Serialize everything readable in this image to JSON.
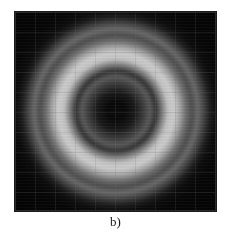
{
  "figure": {
    "caption": "b)",
    "panel_background": "#060606",
    "page_background": "#ffffff",
    "colormap": "grayscale",
    "grid_visible": true,
    "grid_spacing_px": 20,
    "panel": {
      "left_px": 15,
      "top_px": 12,
      "width_px": 201,
      "height_px": 199
    }
  },
  "chart_data": {
    "type": "heatmap",
    "title": "",
    "subtitle": "",
    "xlabel": "",
    "ylabel": "",
    "annotations": [
      "b)"
    ],
    "legend": [],
    "legend_position": "none",
    "grid": true,
    "colormap": "gray",
    "value_range": [
      0,
      255
    ],
    "center": {
      "x_px": 115,
      "y_px": 110
    },
    "xlim": [
      0,
      201
    ],
    "ylim": [
      0,
      199
    ],
    "radial_profile": {
      "radius_px": [
        0,
        9,
        19,
        28,
        34,
        40,
        46,
        52,
        58,
        64,
        70,
        76,
        82,
        88,
        94,
        100
      ],
      "intensity": [
        11,
        9,
        26,
        62,
        90,
        51,
        125,
        194,
        205,
        165,
        108,
        70,
        95,
        58,
        21,
        7
      ]
    },
    "rings": [
      {
        "name": "dark-core",
        "r_inner_px": 0,
        "r_outer_px": 20,
        "mean_intensity": 11,
        "hex": "#0b0b0b"
      },
      {
        "name": "inner-rise",
        "r_inner_px": 20,
        "r_outer_px": 28,
        "mean_intensity": 40,
        "hex": "#282828"
      },
      {
        "name": "first-gray-ring",
        "r_inner_px": 28,
        "r_outer_px": 36,
        "mean_intensity": 100,
        "hex": "#646464"
      },
      {
        "name": "first-dark-gap",
        "r_inner_px": 36,
        "r_outer_px": 44,
        "mean_intensity": 54,
        "hex": "#363636"
      },
      {
        "name": "bright-annulus",
        "r_inner_px": 44,
        "r_outer_px": 70,
        "mean_intensity": 199,
        "hex": "#c7c7c7"
      },
      {
        "name": "second-dark-gap",
        "r_inner_px": 70,
        "r_outer_px": 76,
        "mean_intensity": 62,
        "hex": "#3e3e3e"
      },
      {
        "name": "outer-gray-ring",
        "r_inner_px": 76,
        "r_outer_px": 84,
        "mean_intensity": 94,
        "hex": "#5e5e5e"
      },
      {
        "name": "outer-falloff",
        "r_inner_px": 84,
        "r_outer_px": 100,
        "mean_intensity": 20,
        "hex": "#141414"
      }
    ],
    "peak": {
      "radius_px": 58,
      "intensity": 205
    },
    "minimum": {
      "radius_px": 9,
      "intensity": 9
    }
  }
}
